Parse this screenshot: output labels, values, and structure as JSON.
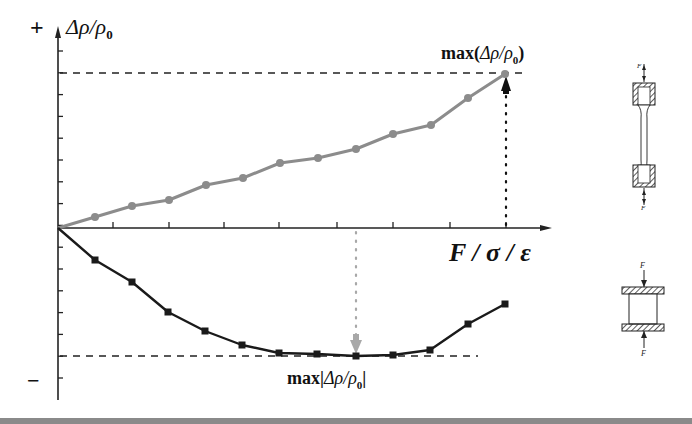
{
  "chart_data": {
    "type": "line",
    "title": "",
    "xlabel": "F / σ / ε",
    "ylabel": "Δρ/ρ0",
    "y_positive_label": "+",
    "y_negative_label": "−",
    "grid": false,
    "legend": null,
    "axis_ticks": "unlabeled",
    "series": [
      {
        "name": "tensile (dog-bone specimen)",
        "color": "#8c8c8c",
        "marker": "circle",
        "x": [
          0,
          1,
          2,
          3,
          4,
          5,
          6,
          7,
          8,
          9,
          10,
          11,
          12
        ],
        "y": [
          0,
          0.07,
          0.15,
          0.19,
          0.28,
          0.33,
          0.42,
          0.46,
          0.53,
          0.63,
          0.69,
          0.85,
          1.0
        ],
        "px": [
          [
            58,
            228
          ],
          [
            95,
            217
          ],
          [
            132,
            206
          ],
          [
            169,
            200
          ],
          [
            206,
            185
          ],
          [
            243,
            178
          ],
          [
            280,
            163
          ],
          [
            318,
            158
          ],
          [
            356,
            149
          ],
          [
            393,
            134
          ],
          [
            431,
            125
          ],
          [
            468,
            98
          ],
          [
            505,
            74
          ]
        ]
      },
      {
        "name": "compressive (cylindrical specimen)",
        "color": "#1a1a1a",
        "marker": "square",
        "x": [
          0,
          1,
          2,
          3,
          4,
          5,
          6,
          7,
          8,
          9,
          10,
          11,
          12
        ],
        "y": [
          0,
          -0.25,
          -0.42,
          -0.66,
          -0.8,
          -0.91,
          -0.98,
          -0.99,
          -1.0,
          -0.99,
          -0.95,
          -0.75,
          -0.59
        ],
        "px": [
          [
            58,
            228
          ],
          [
            95,
            260
          ],
          [
            132,
            282
          ],
          [
            168,
            312
          ],
          [
            205,
            331
          ],
          [
            242,
            345
          ],
          [
            279,
            353
          ],
          [
            317,
            354
          ],
          [
            356,
            356
          ],
          [
            393,
            355
          ],
          [
            430,
            350
          ],
          [
            468,
            324
          ],
          [
            505,
            304
          ]
        ]
      }
    ],
    "annotations": [
      {
        "text": "max(Δρ/ρ0)",
        "target": "upper series max at x=12",
        "marker": "black dotted vertical line with upward arrow"
      },
      {
        "text": "max|Δρ/ρ0|",
        "target": "lower series extreme at x=8",
        "marker": "gray dotted vertical line with downward arrow"
      }
    ],
    "reference_lines": [
      {
        "type": "dashed-horizontal",
        "level": "max(Δρ/ρ0)"
      },
      {
        "type": "dashed-horizontal",
        "level": "-max|Δρ/ρ0|"
      }
    ]
  },
  "labels": {
    "plus": "+",
    "minus": "−",
    "ylabel_main": "Δρ/ρ",
    "ylabel_sub": "0",
    "xlabel": "F / σ / ε",
    "max_pos_prefix": "max(",
    "max_pos_body": "Δρ/ρ",
    "max_pos_sub": "0",
    "max_pos_suffix": ")",
    "max_neg_prefix": "max|",
    "max_neg_body": "Δρ/ρ",
    "max_neg_sub": "0",
    "max_neg_suffix": "|"
  },
  "specimens": {
    "tensile_force_label": "F",
    "compressive_force_label": "F"
  }
}
